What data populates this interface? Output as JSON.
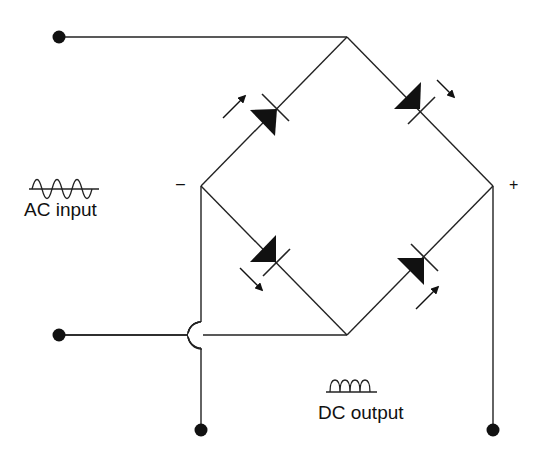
{
  "diagram": {
    "type": "bridge-rectifier",
    "labels": {
      "ac_input": "AC input",
      "dc_output": "DC output",
      "negative": "–",
      "positive": "+"
    },
    "symbols": {
      "ac_waveform": "sine-wave-icon",
      "dc_waveform": "rectified-wave-icon"
    },
    "components": [
      {
        "id": "D1",
        "type": "light-emitting-diode",
        "position": "top-left",
        "arrow": "outward"
      },
      {
        "id": "D2",
        "type": "photodiode",
        "position": "top-right",
        "arrow": "outward"
      },
      {
        "id": "D3",
        "type": "photodiode",
        "position": "bottom-left",
        "arrow": "outward"
      },
      {
        "id": "D4",
        "type": "light-emitting-diode",
        "position": "bottom-right",
        "arrow": "inward"
      }
    ],
    "terminals": [
      "ac-input-top",
      "ac-input-bottom",
      "dc-output-negative",
      "dc-output-positive"
    ],
    "colors": {
      "line": "#222222",
      "background": "#ffffff"
    }
  }
}
